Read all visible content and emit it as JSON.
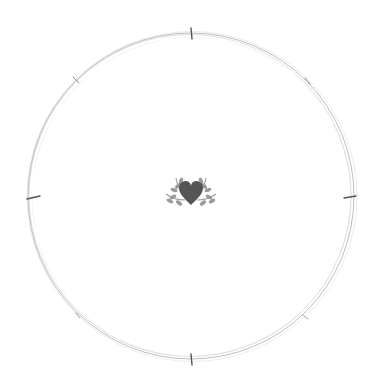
{
  "canvas": {
    "width": 381,
    "height": 390,
    "background": "#ffffff"
  },
  "frame": {
    "type": "sketchy-double-circle",
    "center": [
      191,
      196
    ],
    "radius": 163,
    "stroke_color": "#9a9a9a",
    "ticks": [
      "12",
      "1:30",
      "3",
      "4:30",
      "6",
      "7:30",
      "9",
      "10:30"
    ]
  },
  "emblem": {
    "icon": "heart-with-leaves-icon",
    "heart_color": "#555555",
    "leaf_color": "#9a9a9a"
  }
}
